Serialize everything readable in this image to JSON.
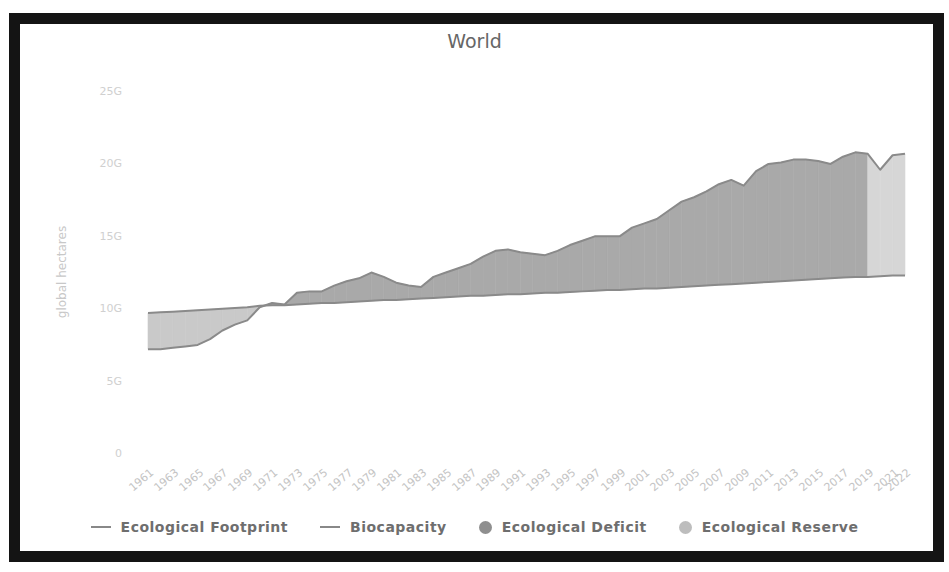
{
  "chart_data": {
    "type": "area",
    "title": "World",
    "xlabel": "",
    "ylabel": "global hectares",
    "ylim": [
      0,
      25
    ],
    "y_unit": "G",
    "yticks": [
      "0",
      "5G",
      "10G",
      "15G",
      "20G",
      "25G"
    ],
    "ytick_values": [
      0,
      5,
      10,
      15,
      20,
      25
    ],
    "xtick_labels": [
      "1961",
      "1963",
      "1965",
      "1967",
      "1969",
      "1971",
      "1973",
      "1975",
      "1977",
      "1979",
      "1981",
      "1983",
      "1985",
      "1987",
      "1989",
      "1991",
      "1993",
      "1995",
      "1997",
      "1999",
      "2001",
      "2003",
      "2005",
      "2007",
      "2009",
      "2011",
      "2013",
      "2015",
      "2017",
      "2019",
      "2021",
      "2022"
    ],
    "grid": false,
    "legend_position": "bottom",
    "x": [
      1961,
      1962,
      1963,
      1964,
      1965,
      1966,
      1967,
      1968,
      1969,
      1970,
      1971,
      1972,
      1973,
      1974,
      1975,
      1976,
      1977,
      1978,
      1979,
      1980,
      1981,
      1982,
      1983,
      1984,
      1985,
      1986,
      1987,
      1988,
      1989,
      1990,
      1991,
      1992,
      1993,
      1994,
      1995,
      1996,
      1997,
      1998,
      1999,
      2000,
      2001,
      2002,
      2003,
      2004,
      2005,
      2006,
      2007,
      2008,
      2009,
      2010,
      2011,
      2012,
      2013,
      2014,
      2015,
      2016,
      2017,
      2018,
      2019,
      2020,
      2021,
      2022
    ],
    "series": [
      {
        "name": "Ecological Footprint",
        "type": "line",
        "values": [
          7.3,
          7.3,
          7.4,
          7.5,
          7.6,
          8.0,
          8.6,
          9.0,
          9.3,
          10.2,
          10.5,
          10.4,
          11.2,
          11.3,
          11.3,
          11.7,
          12.0,
          12.2,
          12.6,
          12.3,
          11.9,
          11.7,
          11.6,
          12.3,
          12.6,
          12.9,
          13.2,
          13.7,
          14.1,
          14.2,
          14.0,
          13.9,
          13.8,
          14.1,
          14.5,
          14.8,
          15.1,
          15.1,
          15.1,
          15.7,
          16.0,
          16.3,
          16.9,
          17.5,
          17.8,
          18.2,
          18.7,
          19.0,
          18.6,
          19.6,
          20.1,
          20.2,
          20.4,
          20.4,
          20.3,
          20.1,
          20.6,
          20.9,
          20.8,
          19.7,
          20.7,
          20.8
        ]
      },
      {
        "name": "Biocapacity",
        "type": "line",
        "values": [
          9.8,
          9.85,
          9.9,
          9.95,
          10.0,
          10.05,
          10.1,
          10.15,
          10.2,
          10.3,
          10.35,
          10.35,
          10.4,
          10.45,
          10.5,
          10.5,
          10.55,
          10.6,
          10.65,
          10.7,
          10.7,
          10.75,
          10.8,
          10.85,
          10.9,
          10.95,
          11.0,
          11.0,
          11.05,
          11.1,
          11.1,
          11.15,
          11.2,
          11.2,
          11.25,
          11.3,
          11.35,
          11.4,
          11.4,
          11.45,
          11.5,
          11.5,
          11.55,
          11.6,
          11.65,
          11.7,
          11.75,
          11.8,
          11.85,
          11.9,
          11.95,
          12.0,
          12.05,
          12.1,
          12.15,
          12.2,
          12.25,
          12.3,
          12.3,
          12.35,
          12.4,
          12.4
        ]
      }
    ],
    "areas": [
      {
        "name": "Ecological Deficit",
        "description": "area where footprint exceeds biocapacity"
      },
      {
        "name": "Ecological Reserve",
        "description": "area where biocapacity exceeds footprint"
      }
    ],
    "shaded_projection_start": 2020
  },
  "legend": {
    "items": [
      {
        "label": "Ecological Footprint",
        "kind": "line",
        "color": "#888888"
      },
      {
        "label": "Biocapacity",
        "kind": "line",
        "color": "#888888"
      },
      {
        "label": "Ecological Deficit",
        "kind": "dot",
        "color": "#8f8f8f"
      },
      {
        "label": "Ecological Reserve",
        "kind": "dot",
        "color": "#bdbdbd"
      }
    ]
  },
  "colors": {
    "deficit_fill": "#a9a9a9",
    "reserve_fill": "#c9c9c9",
    "projection_fill": "#d6d6d6",
    "line": "#8a8a8a",
    "frame": "#141414"
  }
}
